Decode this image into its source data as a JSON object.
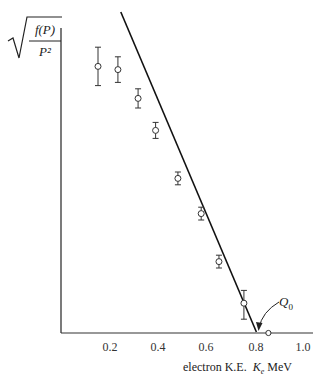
{
  "chart_data": {
    "type": "scatter",
    "title": "",
    "ylabel": "sqrt(f(P)/P^2)",
    "ylabel_parts": {
      "numerator": "f(P)",
      "denominator": "P²"
    },
    "xlabel": "electron K.E.  Ke MeV",
    "xlabel_parts": {
      "prefix": "electron K.E.",
      "symbol": "K",
      "subscript": "e",
      "unit": "MeV"
    },
    "xlim": [
      0,
      1.0
    ],
    "ylim": [
      0,
      1.0
    ],
    "x_ticks": [
      "0.2",
      "0.4",
      "0.6",
      "0.8",
      "1.0"
    ],
    "y_ticks": [],
    "grid": false,
    "legend": null,
    "series": [
      {
        "name": "measured points (with error bars)",
        "marker": "open-circle",
        "x": [
          0.15,
          0.233,
          0.317,
          0.39,
          0.483,
          0.58,
          0.654,
          0.758
        ],
        "y": [
          0.83,
          0.82,
          0.73,
          0.63,
          0.48,
          0.37,
          0.22,
          0.09
        ],
        "yerr_low": [
          0.06,
          0.04,
          0.03,
          0.025,
          0.02,
          0.02,
          0.02,
          0.05
        ],
        "yerr_high": [
          0.06,
          0.04,
          0.03,
          0.025,
          0.02,
          0.02,
          0.02,
          0.04
        ]
      },
      {
        "name": "endpoint",
        "marker": "open-circle-small",
        "x": [
          0.86
        ],
        "y": [
          0.0
        ]
      },
      {
        "name": "Kurie fit line",
        "type": "line",
        "x": [
          0.245,
          0.81
        ],
        "y": [
          1.0,
          0.0
        ]
      }
    ],
    "annotations": [
      {
        "text": "Q0",
        "points_to_x": 0.81,
        "points_to_y": 0.0
      }
    ]
  },
  "labels": {
    "q0_main": "Q",
    "q0_sub": "0",
    "y_num": "f(P)",
    "y_den": "P²",
    "x_prefix": "electron K.E.",
    "x_symbol": "K",
    "x_sub": "e",
    "x_unit": "MeV"
  },
  "ticks": [
    "0.2",
    "0.4",
    "0.6",
    "0.8",
    "1.0"
  ]
}
